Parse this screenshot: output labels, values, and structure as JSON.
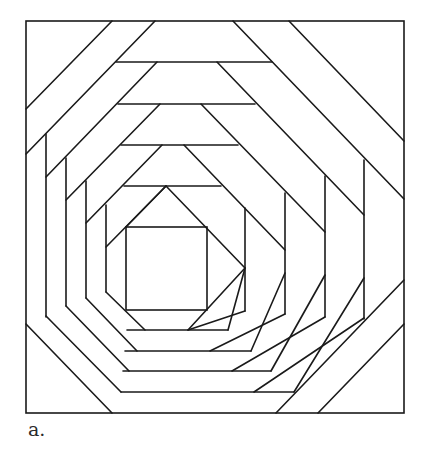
{
  "figure": {
    "caption": "a.",
    "stroke_color": "#1a1a1a",
    "background": "#ffffff"
  }
}
